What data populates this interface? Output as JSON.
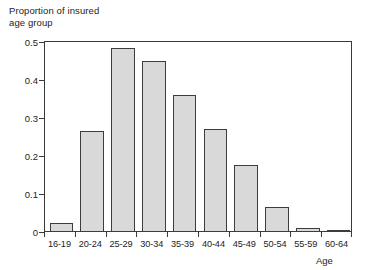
{
  "chart_data": {
    "type": "bar",
    "title": "",
    "ylabel": "Proportion of insured\nage group",
    "xlabel": "Age",
    "categories": [
      "16-19",
      "20-24",
      "25-29",
      "30-34",
      "35-39",
      "40-44",
      "45-49",
      "50-54",
      "55-59",
      "60-64"
    ],
    "values": [
      0.023,
      0.267,
      0.485,
      0.449,
      0.36,
      0.271,
      0.176,
      0.066,
      0.011,
      0.005
    ],
    "ylim": [
      0,
      0.5
    ],
    "yticks": [
      0,
      0.1,
      0.2,
      0.3,
      0.4,
      0.5
    ],
    "ytick_labels": [
      "0",
      "0.1",
      "0.2",
      "0.3",
      "0.4",
      "0.5"
    ],
    "grid": false,
    "legend": null,
    "bar_fill_color": "#d9d9d9",
    "bar_edge_color": "#3d3d3d",
    "axis_color": "#3a3a3a"
  }
}
